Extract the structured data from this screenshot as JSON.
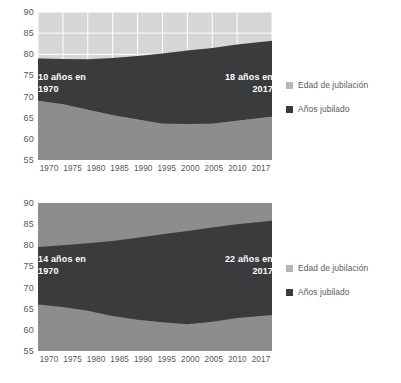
{
  "page": {
    "background": "#ffffff"
  },
  "colors": {
    "retirement_age_band": "#d5d6d8",
    "retirement_age_band_alt": "#8b8d8f",
    "years_retired_band": "#3a3b3d",
    "base_area": "#8b8d8f",
    "gridline": "#ffffff",
    "axis_text": "#54585c",
    "annotation_text": "#ffffff",
    "legend_text": "#59595b"
  },
  "legend": {
    "items": [
      {
        "label": "Edad de jubilación",
        "swatch": "#b4b6b8"
      },
      {
        "label": "Años jubilado",
        "swatch": "#3a3b3d"
      }
    ]
  },
  "chart_data": [
    {
      "id": "chart-1",
      "type": "area",
      "title": "",
      "subtitle": "",
      "xlabel": "",
      "ylabel": "",
      "stacked": false,
      "grid": true,
      "legend_position": "right",
      "ylim": [
        55,
        90
      ],
      "yticks": [
        90,
        85,
        80,
        75,
        70,
        65,
        60,
        55
      ],
      "xlim": [
        1970,
        2017
      ],
      "xticks": [
        1970,
        1975,
        1980,
        1985,
        1990,
        1995,
        2000,
        2005,
        2010,
        2017
      ],
      "xtick_labels": [
        "1970",
        "1975",
        "1980",
        "1985",
        "1990",
        "1995",
        "2000",
        "2005",
        "2010",
        "2017"
      ],
      "x": [
        1970,
        1975,
        1980,
        1985,
        1990,
        1995,
        2000,
        2005,
        2010,
        2017
      ],
      "series": [
        {
          "name": "Edad de jubilación",
          "description": "Upper boundary: life expectancy at retirement (top of dark band)",
          "values": [
            79.0,
            78.9,
            78.8,
            79.1,
            79.6,
            80.2,
            80.9,
            81.5,
            82.3,
            83.2
          ]
        },
        {
          "name": "Años jubilado",
          "description": "Lower boundary: age at retirement (bottom of dark band)",
          "values": [
            69.0,
            68.2,
            66.9,
            65.6,
            64.6,
            63.6,
            63.5,
            63.6,
            64.3,
            65.2
          ]
        }
      ],
      "band_widths_years": [
        10,
        10.7,
        11.9,
        13.5,
        15.0,
        16.6,
        17.4,
        17.9,
        18.0,
        18.0
      ],
      "annotations": [
        {
          "text": "10 años en\n1970",
          "align": "left",
          "at_x": 1970,
          "value": 10
        },
        {
          "text": "18 años en\n2017",
          "align": "right",
          "at_x": 2017,
          "value": 18
        }
      ]
    },
    {
      "id": "chart-2",
      "type": "area",
      "title": "",
      "subtitle": "",
      "xlabel": "",
      "ylabel": "",
      "stacked": false,
      "grid": false,
      "legend_position": "right",
      "ylim": [
        55,
        90
      ],
      "yticks": [
        90,
        85,
        80,
        75,
        70,
        65,
        60,
        55
      ],
      "xlim": [
        1970,
        2017
      ],
      "xticks": [
        1970,
        1975,
        1980,
        1985,
        1990,
        1995,
        2000,
        2005,
        2010,
        2017
      ],
      "xtick_labels": [
        "1970",
        "1975",
        "1980",
        "1985",
        "1990",
        "1995",
        "2000",
        "2005",
        "2010",
        "2017"
      ],
      "x": [
        1970,
        1975,
        1980,
        1985,
        1990,
        1995,
        2000,
        2005,
        2010,
        2017
      ],
      "series": [
        {
          "name": "Edad de jubilación",
          "description": "Upper boundary: life expectancy at retirement (top of dark band)",
          "values": [
            79.6,
            80.0,
            80.5,
            81.0,
            81.8,
            82.6,
            83.4,
            84.2,
            85.0,
            85.8
          ]
        },
        {
          "name": "Años jubilado",
          "description": "Lower boundary: age at retirement (bottom of dark band)",
          "values": [
            66.0,
            65.4,
            64.5,
            63.3,
            62.4,
            61.8,
            61.3,
            61.9,
            62.8,
            63.5
          ]
        }
      ],
      "band_widths_years": [
        13.6,
        14.6,
        16.0,
        17.7,
        19.4,
        20.8,
        22.1,
        22.3,
        22.2,
        22.3
      ],
      "annotations": [
        {
          "text": "14 años en\n1970",
          "align": "left",
          "at_x": 1970,
          "value": 14
        },
        {
          "text": "22 años en\n2017",
          "align": "right",
          "at_x": 2017,
          "value": 22
        }
      ]
    }
  ]
}
